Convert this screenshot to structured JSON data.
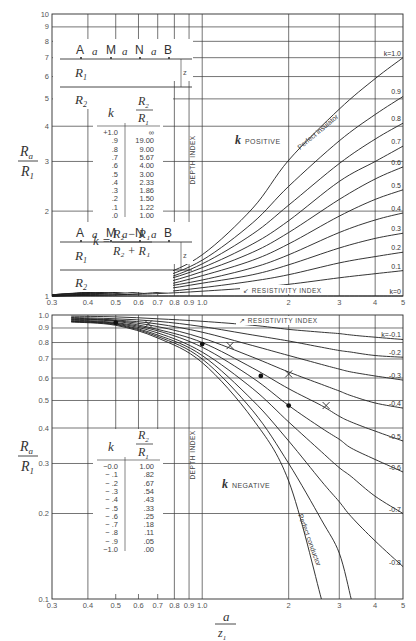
{
  "chart_data": [
    {
      "type": "line",
      "title": "",
      "region_label": {
        "k": "k",
        "text": "POSITIVE"
      },
      "xlabel": "a / z1",
      "ylabel": "Ra / R1",
      "xscale": "log",
      "yscale": "log",
      "xlim": [
        0.3,
        5
      ],
      "ylim": [
        1,
        10
      ],
      "x_ticks": [
        "0.3",
        "0.4",
        "0.5",
        "0.6",
        "0.7",
        "0.8",
        "0.9",
        "1.0",
        "2",
        "3",
        "4",
        "5"
      ],
      "y_ticks": [
        "1",
        "2",
        "3",
        "4",
        "5",
        "6",
        "7",
        "8",
        "9",
        "10"
      ],
      "grid": true,
      "annotations": [
        "DEPTH INDEX",
        "RESISTIVITY INDEX",
        "Perfect insulator"
      ],
      "x": [
        0.3,
        0.5,
        0.7,
        1.0,
        1.5,
        2.0,
        3.0,
        4.0,
        5.0
      ],
      "series": [
        {
          "name": "k = 1.0",
          "label": "k=1.0",
          "values": [
            1.01,
            1.06,
            1.17,
            1.4,
            2.05,
            3.03,
            4.6,
            5.9,
            7.0
          ]
        },
        {
          "name": "0.9",
          "label": "0.9",
          "values": [
            1.01,
            1.05,
            1.15,
            1.34,
            1.82,
            2.45,
            3.55,
            4.4,
            5.1
          ]
        },
        {
          "name": "0.8",
          "label": "0.8",
          "values": [
            1.01,
            1.05,
            1.13,
            1.3,
            1.66,
            2.1,
            2.95,
            3.6,
            4.1
          ]
        },
        {
          "name": "0.7",
          "label": "0.7",
          "values": [
            1.01,
            1.04,
            1.12,
            1.26,
            1.53,
            1.85,
            2.55,
            3.0,
            3.4
          ]
        },
        {
          "name": "0.6",
          "label": "0.6",
          "values": [
            1.0,
            1.04,
            1.1,
            1.22,
            1.43,
            1.68,
            2.2,
            2.6,
            2.87
          ]
        },
        {
          "name": "0.5",
          "label": "0.5",
          "values": [
            1.0,
            1.03,
            1.08,
            1.18,
            1.34,
            1.53,
            1.92,
            2.2,
            2.38
          ]
        },
        {
          "name": "0.4",
          "label": "0.4",
          "values": [
            1.0,
            1.03,
            1.07,
            1.14,
            1.26,
            1.4,
            1.68,
            1.86,
            1.97
          ]
        },
        {
          "name": "0.3",
          "label": "0.3",
          "values": [
            1.0,
            1.02,
            1.05,
            1.11,
            1.19,
            1.29,
            1.48,
            1.6,
            1.67
          ]
        },
        {
          "name": "0.2",
          "label": "0.2",
          "values": [
            1.0,
            1.01,
            1.03,
            1.07,
            1.13,
            1.19,
            1.31,
            1.38,
            1.43
          ]
        },
        {
          "name": "0.1",
          "label": "0.1",
          "values": [
            1.0,
            1.01,
            1.02,
            1.04,
            1.07,
            1.1,
            1.16,
            1.2,
            1.23
          ]
        },
        {
          "name": "k = 0",
          "label": "k=0",
          "values": [
            1.0,
            1.0,
            1.0,
            1.0,
            1.0,
            1.0,
            1.0,
            1.0,
            1.0
          ]
        }
      ],
      "inset_table": {
        "headers": [
          "k",
          "R2/R1"
        ],
        "rows": [
          [
            "+1.0",
            "∞"
          ],
          [
            ".9",
            "19.00"
          ],
          [
            ".8",
            "9.00"
          ],
          [
            ".7",
            "5.67"
          ],
          [
            ".6",
            "4.00"
          ],
          [
            ".5",
            "3.00"
          ],
          [
            ".4",
            "2.33"
          ],
          [
            ".3",
            "1.86"
          ],
          [
            ".2",
            "1.50"
          ],
          [
            ".1",
            "1.22"
          ],
          [
            ".0",
            "1.00"
          ]
        ]
      },
      "formula": "k = (R2 − R1) / (R2 + R1)"
    },
    {
      "type": "line",
      "title": "",
      "region_label": {
        "k": "k",
        "text": "NEGATIVE"
      },
      "xlabel": "a / z1",
      "ylabel": "Ra / R1",
      "xscale": "log",
      "yscale": "log",
      "xlim": [
        0.3,
        5
      ],
      "ylim": [
        0.1,
        1.0
      ],
      "x_ticks": [
        "0.3",
        "0.4",
        "0.5",
        "0.6",
        "0.7",
        "0.8",
        "0.9",
        "1.0",
        "2",
        "3",
        "4",
        "5"
      ],
      "y_ticks": [
        "0.1",
        "0.2",
        "0.3",
        "0.4",
        "0.5",
        "0.6",
        "0.7",
        "0.8",
        "0.9",
        "1.0"
      ],
      "grid": true,
      "annotations": [
        "DEPTH INDEX",
        "RESISTIVITY INDEX",
        "Perfect conductor"
      ],
      "x": [
        0.35,
        0.5,
        0.7,
        1.0,
        1.5,
        2.0,
        2.6,
        3.0,
        3.3,
        4.0,
        5.0
      ],
      "series": [
        {
          "name": "k = -0.1",
          "label": "k=-0.1",
          "values": [
            0.99,
            0.985,
            0.97,
            0.95,
            0.92,
            0.89,
            0.87,
            0.86,
            0.85,
            0.835,
            0.82
          ]
        },
        {
          "name": "-0.2",
          "label": "-0.2",
          "values": [
            0.98,
            0.97,
            0.95,
            0.91,
            0.85,
            0.81,
            0.77,
            0.75,
            0.74,
            0.72,
            0.71
          ]
        },
        {
          "name": "-0.3",
          "label": "-0.3",
          "values": [
            0.975,
            0.96,
            0.93,
            0.87,
            0.78,
            0.72,
            0.67,
            0.645,
            0.63,
            0.61,
            0.59
          ]
        },
        {
          "name": "-0.4",
          "label": "-0.4",
          "values": [
            0.97,
            0.955,
            0.91,
            0.83,
            0.71,
            0.63,
            0.57,
            0.54,
            0.52,
            0.49,
            0.47
          ]
        },
        {
          "name": "-0.5",
          "label": "-0.5",
          "values": [
            0.965,
            0.95,
            0.89,
            0.8,
            0.65,
            0.55,
            0.48,
            0.44,
            0.42,
            0.39,
            0.36
          ]
        },
        {
          "name": "-0.6",
          "label": "-0.6",
          "values": [
            0.96,
            0.94,
            0.88,
            0.77,
            0.6,
            0.48,
            0.4,
            0.365,
            0.34,
            0.31,
            0.28
          ]
        },
        {
          "name": "-0.7",
          "label": "-0.7",
          "values": [
            0.955,
            0.935,
            0.865,
            0.74,
            0.55,
            0.42,
            0.33,
            0.29,
            0.27,
            0.23,
            0.2
          ]
        },
        {
          "name": "-0.8",
          "label": "-0.8",
          "values": [
            0.95,
            0.93,
            0.85,
            0.72,
            0.5,
            0.36,
            0.26,
            0.22,
            0.195,
            0.16,
            0.13
          ]
        },
        {
          "name": "-0.9",
          "label": "-0.9",
          "values": [
            0.948,
            0.925,
            0.84,
            0.7,
            0.46,
            0.3,
            0.19,
            0.145,
            0.1,
            null,
            null
          ]
        },
        {
          "name": "-1.0 (Perfect conductor)",
          "label": "-1.0",
          "values": [
            0.945,
            0.92,
            0.83,
            0.68,
            0.43,
            0.26,
            0.1,
            null,
            null,
            null,
            null
          ]
        }
      ],
      "markers": {
        "dots": [
          [
            0.5,
            0.94
          ],
          [
            1.0,
            0.79
          ],
          [
            1.6,
            0.61
          ],
          [
            2.0,
            0.48
          ]
        ],
        "crosses": [
          [
            0.65,
            0.93
          ],
          [
            1.25,
            0.78
          ],
          [
            2.0,
            0.62
          ],
          [
            2.7,
            0.48
          ]
        ]
      },
      "inset_table": {
        "headers": [
          "k",
          "R2/R1"
        ],
        "rows": [
          [
            "−0.0",
            "1.00"
          ],
          [
            "− .1",
            ".82"
          ],
          [
            "− .2",
            ".67"
          ],
          [
            "− .3",
            ".54"
          ],
          [
            "− .4",
            ".43"
          ],
          [
            "− .5",
            ".33"
          ],
          [
            "− .6",
            ".25"
          ],
          [
            "− .7",
            ".18"
          ],
          [
            "− .8",
            ".11"
          ],
          [
            "− .9",
            ".05"
          ],
          [
            "−1.0",
            ".00"
          ]
        ]
      }
    }
  ],
  "labels": {
    "electrodes": [
      "A",
      "M",
      "N",
      "B"
    ],
    "spacing": "a",
    "layer1": "R",
    "layer1_sub": "1",
    "layer2": "R",
    "layer2_sub": "2",
    "z1": "z",
    "z1_sub": "1",
    "ylabel_num": "R",
    "ylabel_num_sub": "a",
    "ylabel_den": "R",
    "ylabel_den_sub": "1",
    "xlabel_num": "a",
    "xlabel_den": "z",
    "xlabel_den_sub": "1",
    "depth_index": "DEPTH INDEX",
    "resistivity_index": "RESISTIVITY INDEX",
    "perfect_insulator": "Perfect insulator",
    "perfect_conductor": "Perfect conductor",
    "formula_lhs": "k =",
    "formula_num": "R₂ − R₁",
    "formula_den": "R₂ + R₁"
  },
  "layout": {
    "x_left": 52,
    "x_right": 403,
    "top_plot": {
      "y_top": 14,
      "y_bottom": 296
    },
    "bottom_plot": {
      "y_top": 315,
      "y_bottom": 599
    },
    "line_color": "#1e1e1e",
    "grid_color": "#3a3a3a"
  }
}
